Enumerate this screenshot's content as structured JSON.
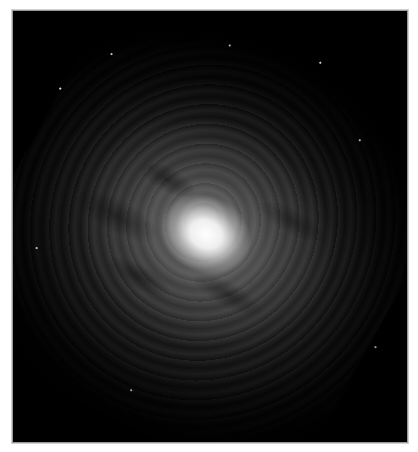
{
  "image": {
    "subject": "spiral galaxy",
    "colors": {
      "background": "#000000",
      "border": "#9a9a9a",
      "page": "#ffffff",
      "core": "#ffffff"
    }
  }
}
